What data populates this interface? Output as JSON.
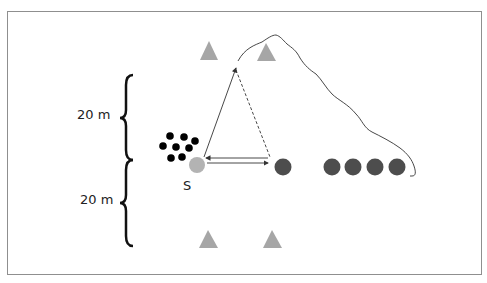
{
  "diagram": {
    "labels": {
      "top_distance": "20 m",
      "bottom_distance": "20 m",
      "start_label": "S"
    },
    "colors": {
      "frame_border": "#8f8f8f",
      "cone": "#a6a6a6",
      "start_marker": "#b3b3b3",
      "player_dark": "#4d4d4d",
      "ball_group": "#000000",
      "line": "#333333"
    },
    "elements": {
      "cones_top": 2,
      "cones_bottom": 2,
      "ball_group_count": 8,
      "waiting_players": 4,
      "target_player": 1
    }
  }
}
